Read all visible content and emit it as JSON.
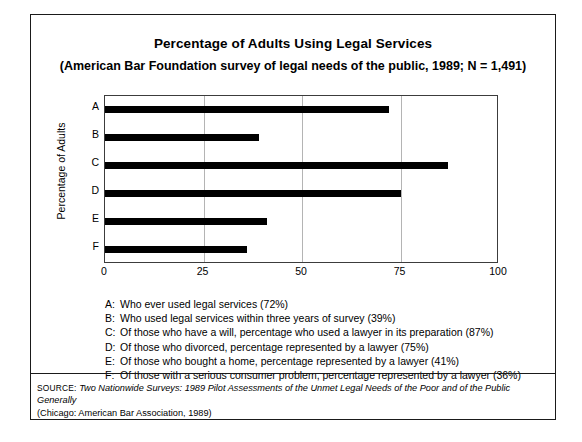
{
  "figure": {
    "title": "Percentage of Adults Using Legal Services",
    "subtitle": "(American Bar Foundation survey of legal needs of the public, 1989; N = 1,491)"
  },
  "chart_data": {
    "type": "bar",
    "orientation": "horizontal",
    "title": "Percentage of Adults Using Legal Services",
    "subtitle": "(American Bar Foundation survey of legal needs of the public, 1989; N = 1,491)",
    "categories": [
      "A",
      "B",
      "C",
      "D",
      "E",
      "F"
    ],
    "values": [
      72,
      39,
      87,
      75,
      41,
      36
    ],
    "xlabel": "",
    "ylabel": "Percentage of Adults",
    "xlim": [
      0,
      100
    ],
    "xticks": [
      0,
      25,
      50,
      75,
      100
    ],
    "xticklabels": [
      "0",
      "25",
      "50",
      "75",
      "100"
    ],
    "grid": "vertical-gridlines-at-25-50-75",
    "legend": "none",
    "bar_color": "#000000",
    "gridline_color": "#b4b4b4",
    "axis_color": "#3c3c3c"
  },
  "key": {
    "items": [
      {
        "letter": "A:",
        "text": "Who ever used legal services (72%)"
      },
      {
        "letter": "B:",
        "text": "Who used legal services within three years of survey (39%)"
      },
      {
        "letter": "C:",
        "text": "Of those who have a will, percentage who used a lawyer in its preparation (87%)"
      },
      {
        "letter": "D:",
        "text": "Of those who divorced, percentage represented by a lawyer (75%)"
      },
      {
        "letter": "E:",
        "text": "Of those who bought a home, percentage represented by a lawyer (41%)"
      },
      {
        "letter": "F:",
        "text": "Of those with a serious consumer problem, percentage represented by a lawyer (36%)"
      }
    ]
  },
  "source": {
    "label": "SOURCE:",
    "title": "Two Nationwide Surveys: 1989 Pilot Assessments of the Unmet Legal Needs of the Poor and of the Public Generally",
    "publisher": "(Chicago: American Bar Association, 1989)"
  }
}
